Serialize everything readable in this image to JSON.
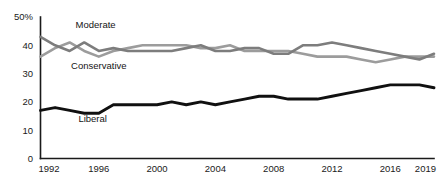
{
  "chart_data": {
    "type": "line",
    "title": "",
    "subtitle": "",
    "xlabel": "",
    "ylabel": "",
    "xlim": [
      1992,
      2019
    ],
    "ylim": [
      0,
      50
    ],
    "grid": false,
    "legend_position": "inline-annotations",
    "x": [
      1992,
      1993,
      1994,
      1995,
      1996,
      1997,
      1998,
      1999,
      2000,
      2001,
      2002,
      2003,
      2004,
      2005,
      2006,
      2007,
      2008,
      2009,
      2010,
      2011,
      2012,
      2013,
      2014,
      2015,
      2016,
      2017,
      2018,
      2019
    ],
    "y_ticks": [
      0,
      10,
      20,
      30,
      40,
      50
    ],
    "y_tick_labels": [
      "0",
      "10",
      "20",
      "30",
      "40",
      "50%"
    ],
    "x_ticks": [
      1992,
      1996,
      2000,
      2004,
      2008,
      2012,
      2016,
      2019
    ],
    "x_tick_labels": [
      "1992",
      "1996",
      "2000",
      "2004",
      "2008",
      "2012",
      "2016",
      "2019"
    ],
    "series": [
      {
        "name": "Moderate",
        "color": "#9c9c9c",
        "label_x": 1994.4,
        "label_y": 46.0,
        "values": [
          36,
          39,
          41,
          38,
          36,
          38,
          39,
          40,
          40,
          40,
          40,
          39,
          39,
          40,
          38,
          38,
          38,
          38,
          37,
          36,
          36,
          36,
          35,
          34,
          35,
          36,
          36,
          36
        ]
      },
      {
        "name": "Conservative",
        "color": "#7d7d7d",
        "label_x": 1994.1,
        "label_y": 31.5,
        "values": [
          43,
          40,
          38,
          41,
          38,
          39,
          38,
          38,
          38,
          38,
          39,
          40,
          38,
          38,
          39,
          39,
          37,
          37,
          40,
          40,
          41,
          40,
          39,
          38,
          37,
          36,
          35,
          37
        ]
      },
      {
        "name": "Liberal",
        "color": "#101010",
        "label_x": 1994.6,
        "label_y": 12.8,
        "values": [
          17,
          18,
          17,
          16,
          16,
          19,
          19,
          19,
          19,
          20,
          19,
          20,
          19,
          20,
          21,
          22,
          22,
          21,
          21,
          21,
          22,
          23,
          24,
          25,
          26,
          26,
          26,
          25
        ]
      }
    ]
  },
  "axis": {
    "y_axis_name": "y-axis",
    "x_axis_name": "x-axis"
  }
}
